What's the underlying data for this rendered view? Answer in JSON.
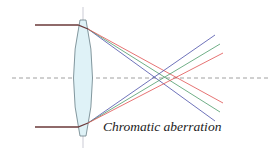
{
  "diagram": {
    "caption": "Chromatic aberration",
    "colors": {
      "incoming_ray": "#6b3a3a",
      "lens_fill": "#dff2f7",
      "lens_stroke": "#6a7f86",
      "axis": "#888888",
      "blue": "#4a4fa8",
      "green": "#4c9a6a",
      "red": "#e05050"
    },
    "rays": [
      {
        "name": "blue",
        "label": "blue ray"
      },
      {
        "name": "green",
        "label": "green ray"
      },
      {
        "name": "red",
        "label": "red ray"
      }
    ]
  }
}
